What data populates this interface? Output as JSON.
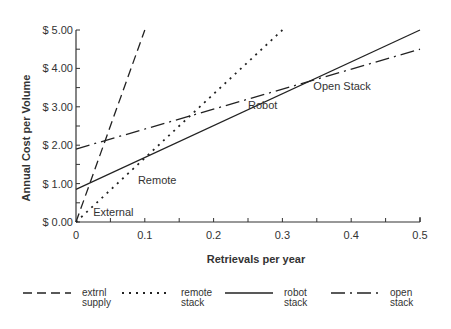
{
  "chart_data": {
    "type": "line",
    "title": "",
    "xlabel": "Retrievals per year",
    "ylabel": "Annual Cost per Volume",
    "xlim": [
      0,
      0.5
    ],
    "ylim": [
      0,
      5
    ],
    "xticks": [
      0,
      0.1,
      0.2,
      0.3,
      0.4,
      0.5
    ],
    "xtick_labels": [
      "0",
      "0.1",
      "0.2",
      "0.3",
      "0.4",
      "0.5"
    ],
    "yticks": [
      0,
      1,
      2,
      3,
      4,
      5
    ],
    "ytick_labels": [
      "$ 0.00",
      "$ 1.00",
      "$ 2.00",
      "$ 3.00",
      "$ 4.00",
      "$ 5.00"
    ],
    "grid": false,
    "legend_position": "bottom",
    "series": [
      {
        "name": "extrnl supply",
        "legend": [
          "extrnl",
          "supply"
        ],
        "style": "long-dash",
        "annotation": "External",
        "x": [
          0,
          0.1
        ],
        "y": [
          0,
          5.0
        ]
      },
      {
        "name": "remote stack",
        "legend": [
          "remote",
          "stack"
        ],
        "style": "dotted",
        "annotation": "Remote",
        "x": [
          0,
          0.3
        ],
        "y": [
          0,
          5.0
        ]
      },
      {
        "name": "robot stack",
        "legend": [
          "robot",
          "stack"
        ],
        "style": "solid",
        "annotation": "Robot",
        "x": [
          0,
          0.5
        ],
        "y": [
          0.85,
          5.0
        ]
      },
      {
        "name": "open stack",
        "legend": [
          "open",
          "stack"
        ],
        "style": "dash-dot",
        "annotation": "Open Stack",
        "x": [
          0,
          0.5
        ],
        "y": [
          1.9,
          4.5
        ]
      }
    ],
    "annotations": [
      {
        "text": "External",
        "x": 0.025,
        "y": 0.15
      },
      {
        "text": "Remote",
        "x": 0.09,
        "y": 1.0
      },
      {
        "text": "Robot",
        "x": 0.25,
        "y": 2.95
      },
      {
        "text": "Open Stack",
        "x": 0.345,
        "y": 3.45
      }
    ]
  }
}
